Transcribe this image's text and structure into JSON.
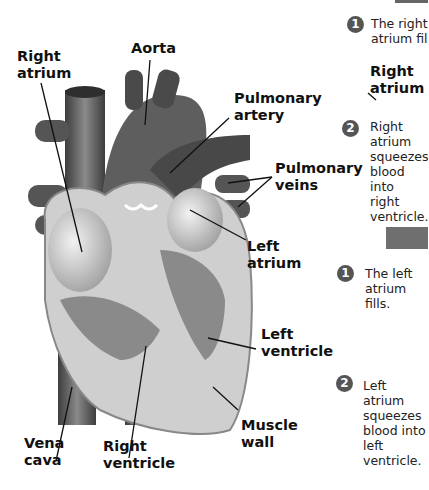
{
  "diagram": {
    "labels": {
      "right_atrium": [
        "Right",
        "atrium"
      ],
      "aorta": "Aorta",
      "pulmonary_artery": [
        "Pulmonary",
        "artery"
      ],
      "pulmonary_veins": [
        "Pulmonary",
        "veins"
      ],
      "left_atrium": [
        "Left",
        "atrium"
      ],
      "left_ventricle": [
        "Left",
        "ventricle"
      ],
      "muscle_wall": [
        "Muscle",
        "wall"
      ],
      "right_ventricle": [
        "Right",
        "ventricle"
      ],
      "vena_cava": [
        "Vena",
        "cava"
      ]
    }
  },
  "side_panel": {
    "right_side": {
      "steps": [
        {
          "number": "1",
          "lines": [
            "The right",
            "atrium fil"
          ]
        },
        {
          "number": "2",
          "lines": [
            "Right",
            "atrium",
            "squeezes",
            "blood into",
            "right",
            "ventricle."
          ]
        }
      ],
      "label": [
        "Right",
        "atrium"
      ]
    },
    "left_side": {
      "steps": [
        {
          "number": "1",
          "lines": [
            "The left",
            "atrium",
            "fills."
          ]
        },
        {
          "number": "2",
          "lines": [
            "Left",
            "atrium",
            "squeezes",
            "blood into",
            "left",
            "ventricle."
          ]
        }
      ]
    }
  },
  "colors": {
    "ink": "#111111",
    "badge": "#555555",
    "heart_dark": "#555555",
    "heart_light": "#d8d8d8"
  }
}
